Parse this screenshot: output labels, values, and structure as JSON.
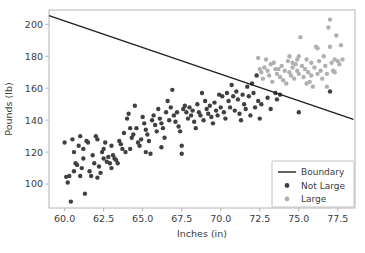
{
  "chart_data": {
    "type": "scatter",
    "title": "",
    "xlabel": "Inches (in)",
    "ylabel": "Pounds (lb)",
    "xlim": [
      59.0,
      78.6
    ],
    "ylim": [
      85.0,
      209.0
    ],
    "xticks": [
      "60.0",
      "62.5",
      "65.0",
      "67.5",
      "70.0",
      "72.5",
      "75.0",
      "77.5"
    ],
    "xtick_values": [
      60.0,
      62.5,
      65.0,
      67.5,
      70.0,
      72.5,
      75.0,
      77.5
    ],
    "yticks": [
      "100",
      "120",
      "140",
      "160",
      "180",
      "200"
    ],
    "ytick_values": [
      100,
      120,
      140,
      160,
      180,
      200
    ],
    "grid": false,
    "legend_position": "lower right",
    "legend": [
      {
        "label": "Boundary",
        "marker": "line",
        "color": "#1f1f1f"
      },
      {
        "label": "Not Large",
        "marker": "dot",
        "color": "#404040"
      },
      {
        "label": "Large",
        "marker": "dot",
        "color": "#b0b0b0"
      }
    ],
    "boundary_line": {
      "name": "Boundary",
      "color": "#1f1f1f",
      "x": [
        59.0,
        78.5
      ],
      "y": [
        205.5,
        140.5
      ]
    },
    "series": [
      {
        "name": "Not Large",
        "color": "#404040",
        "marker_size": 4.4,
        "points": [
          [
            60.0,
            126.0
          ],
          [
            60.1,
            104.5
          ],
          [
            60.2,
            101.0
          ],
          [
            60.3,
            105.0
          ],
          [
            60.4,
            89.0
          ],
          [
            60.5,
            128.0
          ],
          [
            60.6,
            120.0
          ],
          [
            60.7,
            113.0
          ],
          [
            60.8,
            112.0
          ],
          [
            60.9,
            124.0
          ],
          [
            61.0,
            130.0
          ],
          [
            61.0,
            105.0
          ],
          [
            61.1,
            110.0
          ],
          [
            61.2,
            116.0
          ],
          [
            61.3,
            94.0
          ],
          [
            61.4,
            127.0
          ],
          [
            61.5,
            126.0
          ],
          [
            61.6,
            108.0
          ],
          [
            61.7,
            105.0
          ],
          [
            61.8,
            118.0
          ],
          [
            61.9,
            113.0
          ],
          [
            62.0,
            130.0
          ],
          [
            62.1,
            128.0
          ],
          [
            62.2,
            111.0
          ],
          [
            62.3,
            107.0
          ],
          [
            62.4,
            120.0
          ],
          [
            62.5,
            122.0
          ],
          [
            62.5,
            116.0
          ],
          [
            62.6,
            126.0
          ],
          [
            62.7,
            114.0
          ],
          [
            62.8,
            117.0
          ],
          [
            62.9,
            113.0
          ],
          [
            63.0,
            124.0
          ],
          [
            63.1,
            118.0
          ],
          [
            63.2,
            116.0
          ],
          [
            63.3,
            115.0
          ],
          [
            63.4,
            113.0
          ],
          [
            63.5,
            127.0
          ],
          [
            63.6,
            125.0
          ],
          [
            63.7,
            122.0
          ],
          [
            63.8,
            132.0
          ],
          [
            63.9,
            120.0
          ],
          [
            64.0,
            141.0
          ],
          [
            64.1,
            144.0
          ],
          [
            64.2,
            122.0
          ],
          [
            64.3,
            129.0
          ],
          [
            64.4,
            131.0
          ],
          [
            64.5,
            149.0
          ],
          [
            64.6,
            135.0
          ],
          [
            64.7,
            126.0
          ],
          [
            64.8,
            124.0
          ],
          [
            64.9,
            128.0
          ],
          [
            65.0,
            142.0
          ],
          [
            65.1,
            138.0
          ],
          [
            65.2,
            134.0
          ],
          [
            65.3,
            131.0
          ],
          [
            65.4,
            127.0
          ],
          [
            65.5,
            119.0
          ],
          [
            65.6,
            140.0
          ],
          [
            65.7,
            143.0
          ],
          [
            65.8,
            137.0
          ],
          [
            65.9,
            133.0
          ],
          [
            66.0,
            147.0
          ],
          [
            66.1,
            141.0
          ],
          [
            66.2,
            138.0
          ],
          [
            66.3,
            135.0
          ],
          [
            66.4,
            129.0
          ],
          [
            66.5,
            145.0
          ],
          [
            66.6,
            152.0
          ],
          [
            66.7,
            140.0
          ],
          [
            66.8,
            148.0
          ],
          [
            66.9,
            159.0
          ],
          [
            67.0,
            143.0
          ],
          [
            67.1,
            139.0
          ],
          [
            67.2,
            145.0
          ],
          [
            67.3,
            136.0
          ],
          [
            67.4,
            133.0
          ],
          [
            67.5,
            124.0
          ],
          [
            67.5,
            119.0
          ],
          [
            67.6,
            147.0
          ],
          [
            67.7,
            149.0
          ],
          [
            67.8,
            145.0
          ],
          [
            67.9,
            141.0
          ],
          [
            68.0,
            148.0
          ],
          [
            68.1,
            143.0
          ],
          [
            68.2,
            146.0
          ],
          [
            68.3,
            139.0
          ],
          [
            68.4,
            135.0
          ],
          [
            68.5,
            150.0
          ],
          [
            68.6,
            145.0
          ],
          [
            68.7,
            143.0
          ],
          [
            68.8,
            157.0
          ],
          [
            68.9,
            140.0
          ],
          [
            69.0,
            152.0
          ],
          [
            69.1,
            147.0
          ],
          [
            69.2,
            144.0
          ],
          [
            69.3,
            149.0
          ],
          [
            69.4,
            142.0
          ],
          [
            69.5,
            138.0
          ],
          [
            69.6,
            151.0
          ],
          [
            69.7,
            146.0
          ],
          [
            69.8,
            143.0
          ],
          [
            69.9,
            156.0
          ],
          [
            70.0,
            148.0
          ],
          [
            70.1,
            155.0
          ],
          [
            70.2,
            145.0
          ],
          [
            70.3,
            141.0
          ],
          [
            70.4,
            157.0
          ],
          [
            70.5,
            152.0
          ],
          [
            70.6,
            148.0
          ],
          [
            70.7,
            162.0
          ],
          [
            70.8,
            155.0
          ],
          [
            70.9,
            146.0
          ],
          [
            71.0,
            158.0
          ],
          [
            71.1,
            153.0
          ],
          [
            71.2,
            144.0
          ],
          [
            71.3,
            140.0
          ],
          [
            71.4,
            156.0
          ],
          [
            71.5,
            150.0
          ],
          [
            71.6,
            147.0
          ],
          [
            71.7,
            161.0
          ],
          [
            71.8,
            155.0
          ],
          [
            71.9,
            143.0
          ],
          [
            72.0,
            163.0
          ],
          [
            72.1,
            157.0
          ],
          [
            72.2,
            148.0
          ],
          [
            72.3,
            168.0
          ],
          [
            72.4,
            152.0
          ],
          [
            72.5,
            141.0
          ],
          [
            72.6,
            150.0
          ],
          [
            73.0,
            154.0
          ],
          [
            73.2,
            147.0
          ],
          [
            73.5,
            157.0
          ],
          [
            73.6,
            153.0
          ],
          [
            73.8,
            156.0
          ],
          [
            75.0,
            145.0
          ],
          [
            77.0,
            158.0
          ],
          [
            66.2,
            123.0
          ],
          [
            65.2,
            120.0
          ],
          [
            64.2,
            135.0
          ],
          [
            63.0,
            110.0
          ],
          [
            61.2,
            122.0
          ],
          [
            60.6,
            108.0
          ],
          [
            62.1,
            104.0
          ]
        ]
      },
      {
        "name": "Large",
        "color": "#b0b0b0",
        "marker_size": 4.4,
        "points": [
          [
            72.4,
            179.0
          ],
          [
            72.5,
            172.0
          ],
          [
            72.6,
            170.0
          ],
          [
            72.7,
            166.0
          ],
          [
            72.8,
            173.0
          ],
          [
            73.0,
            171.0
          ],
          [
            73.1,
            168.0
          ],
          [
            73.2,
            175.0
          ],
          [
            73.3,
            164.0
          ],
          [
            73.5,
            172.0
          ],
          [
            73.6,
            169.0
          ],
          [
            73.8,
            167.0
          ],
          [
            73.9,
            174.0
          ],
          [
            74.0,
            165.0
          ],
          [
            74.1,
            171.0
          ],
          [
            74.2,
            163.0
          ],
          [
            74.3,
            177.0
          ],
          [
            74.4,
            170.0
          ],
          [
            74.5,
            168.0
          ],
          [
            74.6,
            173.0
          ],
          [
            74.7,
            166.0
          ],
          [
            74.8,
            175.0
          ],
          [
            74.9,
            171.0
          ],
          [
            75.0,
            169.0
          ],
          [
            75.0,
            180.0
          ],
          [
            75.1,
            192.0
          ],
          [
            75.2,
            174.0
          ],
          [
            75.3,
            167.0
          ],
          [
            75.4,
            172.0
          ],
          [
            75.5,
            178.0
          ],
          [
            75.6,
            170.0
          ],
          [
            75.7,
            164.0
          ],
          [
            75.8,
            176.0
          ],
          [
            75.9,
            161.0
          ],
          [
            76.0,
            173.0
          ],
          [
            76.1,
            186.0
          ],
          [
            76.2,
            169.0
          ],
          [
            76.3,
            177.0
          ],
          [
            76.4,
            171.0
          ],
          [
            76.5,
            166.0
          ],
          [
            76.6,
            180.0
          ],
          [
            76.7,
            174.0
          ],
          [
            76.8,
            169.0
          ],
          [
            76.9,
            198.0
          ],
          [
            77.0,
            203.0
          ],
          [
            77.0,
            186.0
          ],
          [
            77.1,
            176.0
          ],
          [
            77.2,
            171.0
          ],
          [
            77.3,
            178.0
          ],
          [
            77.4,
            193.0
          ],
          [
            77.5,
            177.0
          ],
          [
            77.6,
            175.0
          ],
          [
            77.7,
            187.0
          ],
          [
            77.8,
            178.0
          ],
          [
            74.4,
            180.0
          ],
          [
            73.4,
            176.0
          ],
          [
            72.9,
            178.0
          ],
          [
            76.2,
            185.0
          ],
          [
            75.5,
            163.0
          ],
          [
            74.9,
            178.0
          ],
          [
            76.8,
            161.0
          ],
          [
            75.8,
            168.0
          ],
          [
            73.7,
            172.0
          ],
          [
            74.6,
            176.0
          ],
          [
            77.3,
            170.0
          ]
        ]
      }
    ]
  }
}
